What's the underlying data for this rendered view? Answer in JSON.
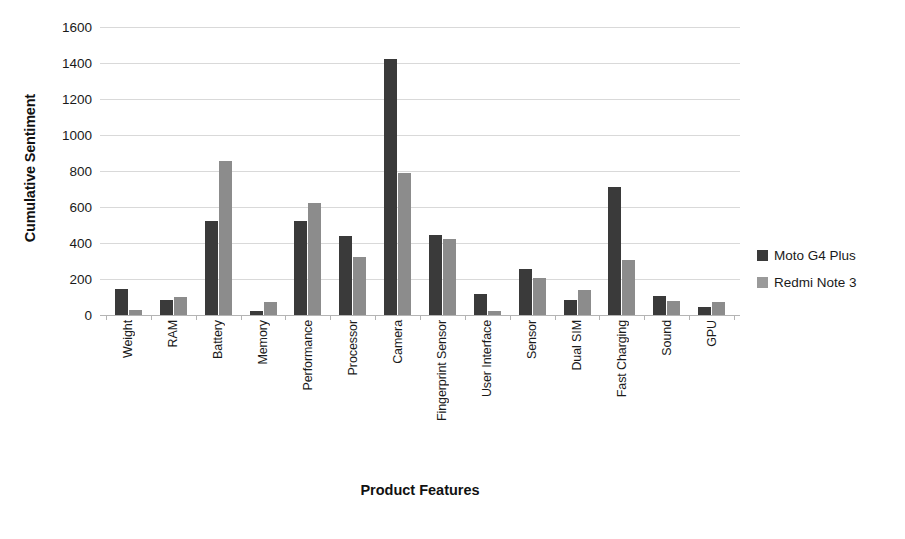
{
  "chart_data": {
    "type": "bar",
    "title": "",
    "xlabel": "Product Features",
    "ylabel": "Cumulative Sentiment",
    "ylim": [
      0,
      1600
    ],
    "ytick_step": 200,
    "yticks": [
      "0",
      "200",
      "400",
      "600",
      "800",
      "1000",
      "1200",
      "1400",
      "1600"
    ],
    "grid": true,
    "legend_position": "right",
    "categories": [
      "Weight",
      "RAM",
      "Battery",
      "Memory",
      "Performance",
      "Processor",
      "Camera",
      "Fingerprint Sensor",
      "User Interface",
      "Sensor",
      "Dual SIM",
      "Fast Charging",
      "Sound",
      "GPU"
    ],
    "series": [
      {
        "name": "Moto G4 Plus",
        "color": "#3a3a3a",
        "values": [
          145,
          85,
          525,
          25,
          520,
          440,
          1420,
          445,
          115,
          255,
          85,
          710,
          105,
          45
        ]
      },
      {
        "name": "Redmi Note 3",
        "color": "#8c8c8c",
        "values": [
          30,
          100,
          855,
          75,
          625,
          320,
          790,
          425,
          25,
          205,
          140,
          305,
          80,
          70
        ]
      }
    ]
  },
  "legend": {
    "items": [
      {
        "label": "Moto G4 Plus"
      },
      {
        "label": "Redmi Note 3"
      }
    ]
  }
}
